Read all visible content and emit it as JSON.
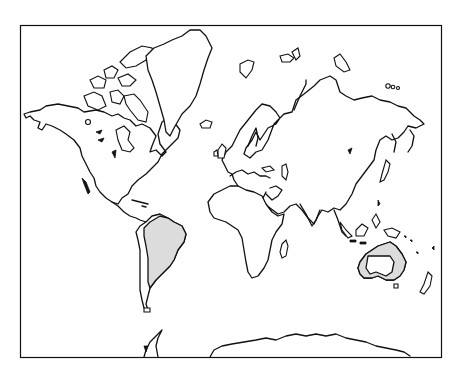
{
  "map": {
    "projection": "mercator-world-outline",
    "frame": {
      "x": 20,
      "y": 25,
      "width": 421,
      "height": 332,
      "stroke": "#111111"
    },
    "colors": {
      "background": "#ffffff",
      "outline": "#111111",
      "highlight_fill": "#dcdcdc"
    },
    "highlighted_regions": [
      {
        "name": "South America (east of Andes)",
        "fill": "#dcdcdc"
      },
      {
        "name": "Australia (coastal rim)",
        "fill": "#dcdcdc"
      }
    ],
    "landmasses": [
      "North America",
      "Greenland",
      "Canadian Arctic Archipelago",
      "South America",
      "Europe",
      "Africa",
      "Asia",
      "Australia",
      "New Zealand",
      "Antarctica",
      "Indonesia",
      "Japan",
      "Madagascar",
      "British Isles",
      "Iceland"
    ]
  }
}
